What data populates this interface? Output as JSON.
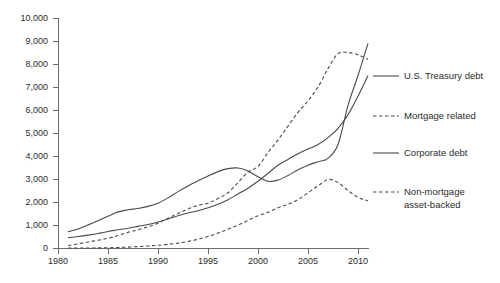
{
  "chart_data": {
    "type": "line",
    "title": "",
    "subtitle": "",
    "xlabel": "",
    "ylabel": "",
    "xlim": [
      1980,
      2011
    ],
    "ylim": [
      0,
      10000
    ],
    "grid": false,
    "legend_position": "right",
    "x_ticks": [
      "1980",
      "1985",
      "1990",
      "1995",
      "2000",
      "2005",
      "2010"
    ],
    "x_tick_values": [
      1980,
      1985,
      1990,
      1995,
      2000,
      2005,
      2010
    ],
    "y_ticks": [
      "0",
      "1,000",
      "2,000",
      "3,000",
      "4,000",
      "5,000",
      "6,000",
      "7,000",
      "8,000",
      "9,000",
      "10,000"
    ],
    "y_tick_values": [
      0,
      1000,
      2000,
      3000,
      4000,
      5000,
      6000,
      7000,
      8000,
      9000,
      10000
    ],
    "x": [
      1981,
      1982,
      1983,
      1984,
      1985,
      1986,
      1987,
      1988,
      1989,
      1990,
      1991,
      1992,
      1993,
      1994,
      1995,
      1996,
      1997,
      1998,
      1999,
      2000,
      2001,
      2002,
      2003,
      2004,
      2005,
      2006,
      2007,
      2008,
      2009,
      2010,
      2011
    ],
    "series": [
      {
        "name": "U.S. Treasury  debt",
        "style": "solid",
        "color": "#4a4a4a",
        "values": [
          700,
          830,
          1000,
          1180,
          1380,
          1570,
          1660,
          1720,
          1810,
          1950,
          2180,
          2450,
          2700,
          2920,
          3130,
          3320,
          3450,
          3480,
          3350,
          3100,
          2900,
          2950,
          3150,
          3400,
          3600,
          3750,
          3900,
          4500,
          6200,
          7500,
          8900
        ]
      },
      {
        "name": "Mortgage related",
        "style": "dashed",
        "color": "#4a4a4a",
        "values": [
          110,
          180,
          260,
          340,
          420,
          540,
          680,
          790,
          920,
          1080,
          1290,
          1500,
          1700,
          1850,
          1950,
          2150,
          2400,
          2850,
          3300,
          3550,
          4150,
          4700,
          5300,
          5900,
          6400,
          7000,
          7800,
          8450,
          8500,
          8400,
          8200
        ]
      },
      {
        "name": "Corporate debt",
        "style": "solid",
        "color": "#4a4a4a",
        "values": [
          450,
          500,
          560,
          630,
          720,
          790,
          860,
          940,
          1020,
          1130,
          1260,
          1400,
          1520,
          1620,
          1750,
          1900,
          2100,
          2350,
          2600,
          2900,
          3250,
          3600,
          3850,
          4100,
          4300,
          4500,
          4800,
          5200,
          5800,
          6600,
          7500
        ]
      },
      {
        "name": "Non-mortgage asset-backed",
        "style": "dashed",
        "color": "#4a4a4a",
        "values": [
          0,
          0,
          0,
          5,
          10,
          20,
          40,
          60,
          90,
          120,
          160,
          210,
          280,
          380,
          500,
          650,
          820,
          1000,
          1200,
          1400,
          1550,
          1750,
          1900,
          2100,
          2400,
          2700,
          2980,
          2850,
          2500,
          2200,
          2050
        ]
      }
    ],
    "legend": [
      {
        "label": "U.S. Treasury  debt",
        "style": "solid"
      },
      {
        "label": "Mortgage related",
        "style": "dashed"
      },
      {
        "label": "Corporate debt",
        "style": "solid"
      },
      {
        "label": "Non-mortgage",
        "label2": "asset-backed",
        "style": "dashed"
      }
    ]
  }
}
